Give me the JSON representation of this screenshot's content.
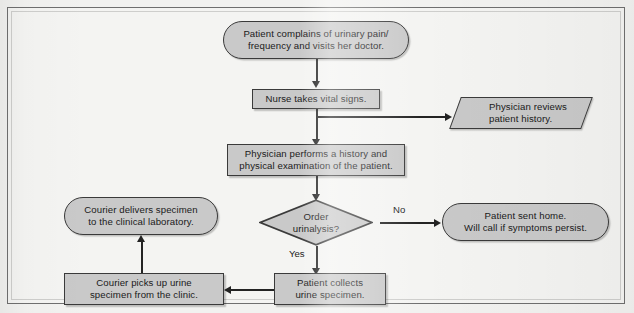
{
  "diagram": {
    "colors": {
      "shape_fill": "#c9c9c9",
      "shape_border": "#3a3a3a",
      "connector": "#232323",
      "canvas": "#f4f4f2",
      "frame_border": "#6f6f6f"
    },
    "nodes": {
      "patient_complains": {
        "shape": "terminator",
        "line1": "Patient complains of urinary pain/",
        "line2": "frequency and visits her doctor."
      },
      "nurse_vitals": {
        "shape": "process",
        "line1": "Nurse takes vital signs."
      },
      "physician_reviews": {
        "shape": "parallelogram",
        "line1": "Physician reviews",
        "line2": "patient history."
      },
      "physician_exam": {
        "shape": "process",
        "line1": "Physician performs a history and",
        "line2": "physical examination of the patient."
      },
      "order_urinalysis": {
        "shape": "decision",
        "line1": "Order",
        "line2": "urinalysis?"
      },
      "patient_sent_home": {
        "shape": "terminator",
        "line1": "Patient sent home.",
        "line2": "Will call if symptoms persist."
      },
      "courier_delivers": {
        "shape": "terminator",
        "line1": "Courier delivers specimen",
        "line2": "to the clinical laboratory."
      },
      "courier_picks_up": {
        "shape": "process",
        "line1": "Courier picks up urine",
        "line2": "specimen from the clinic."
      },
      "patient_collects": {
        "shape": "process",
        "line1": "Patient collects",
        "line2": "urine specimen."
      }
    },
    "edge_labels": {
      "no": "No",
      "yes": "Yes"
    }
  }
}
